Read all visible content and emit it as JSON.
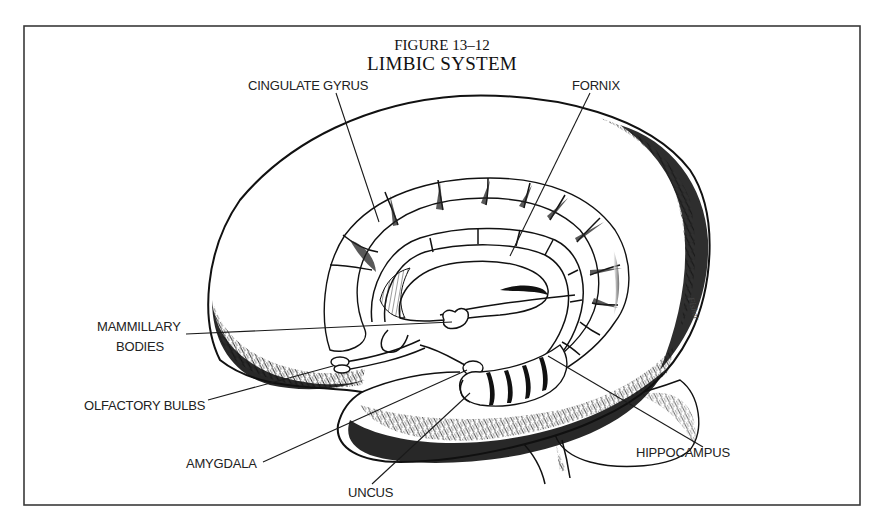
{
  "figure": {
    "number": "FIGURE 13–12",
    "title": "LIMBIC SYSTEM",
    "signature": "Fisher"
  },
  "labels": [
    {
      "id": "cingulate-gyrus",
      "text": "CINGULATE GYRUS",
      "line2": ""
    },
    {
      "id": "fornix",
      "text": "FORNIX",
      "line2": ""
    },
    {
      "id": "mammillary-bodies",
      "text": "MAMMILLARY",
      "line2": "BODIES"
    },
    {
      "id": "olfactory-bulbs",
      "text": "OLFACTORY BULBS",
      "line2": ""
    },
    {
      "id": "amygdala",
      "text": "AMYGDALA",
      "line2": ""
    },
    {
      "id": "uncus",
      "text": "UNCUS",
      "line2": ""
    },
    {
      "id": "hippocampus",
      "text": "HIPPOCAMPUS",
      "line2": ""
    }
  ],
  "colors": {
    "ink": "#111111",
    "background": "#ffffff",
    "frame": "#3a3a3a"
  }
}
